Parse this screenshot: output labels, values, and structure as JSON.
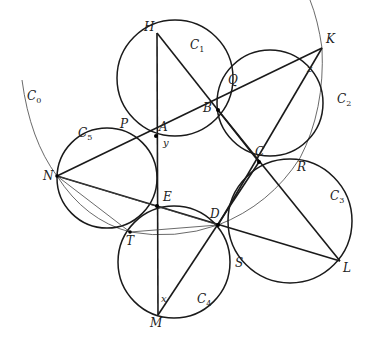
{
  "colors": {
    "stroke": "#1a1a1a",
    "thin": "#444444",
    "background": "#ffffff"
  },
  "points": {
    "H": {
      "label": "H",
      "x": 157,
      "y": 33
    },
    "A": {
      "label": "A",
      "x": 156,
      "y": 136
    },
    "B": {
      "label": "B",
      "x": 218,
      "y": 110
    },
    "C": {
      "label": "C",
      "x": 259,
      "y": 162
    },
    "D": {
      "label": "D",
      "x": 218,
      "y": 225
    },
    "E": {
      "label": "E",
      "x": 157,
      "y": 206
    },
    "K": {
      "label": "K",
      "x": 322,
      "y": 48
    },
    "L": {
      "label": "L",
      "x": 340,
      "y": 261
    },
    "M": {
      "label": "M",
      "x": 158,
      "y": 315
    },
    "N": {
      "label": "N",
      "x": 57,
      "y": 176
    },
    "P": {
      "label": "P",
      "x": 128,
      "y": 117
    },
    "Q": {
      "label": "Q",
      "x": 225,
      "y": 75
    },
    "R": {
      "label": "R",
      "x": 300,
      "y": 158
    },
    "S": {
      "label": "S",
      "x": 232,
      "y": 263
    },
    "T": {
      "label": "T",
      "x": 130,
      "y": 232
    }
  },
  "circles": [
    {
      "name": "C",
      "sub": "1",
      "cx": 175,
      "cy": 78,
      "r": 58
    },
    {
      "name": "C",
      "sub": "2",
      "cx": 270,
      "cy": 103,
      "r": 53
    },
    {
      "name": "C",
      "sub": "3",
      "cx": 290,
      "cy": 221,
      "r": 62
    },
    {
      "name": "C",
      "sub": "4",
      "cx": 174,
      "cy": 262,
      "r": 56
    },
    {
      "name": "C",
      "sub": "5",
      "cx": 107,
      "cy": 178,
      "r": 50
    }
  ],
  "big_circle": {
    "name": "C",
    "sub": "0"
  },
  "angles": {
    "x": "x",
    "y": "y",
    "z": "z"
  }
}
